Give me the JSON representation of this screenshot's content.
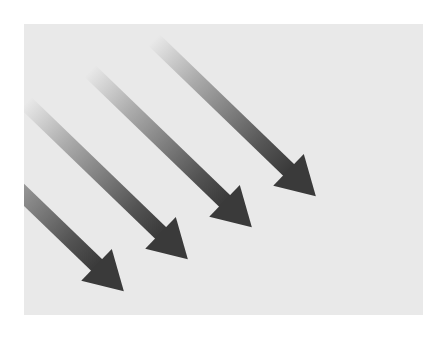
{
  "image": {
    "description": "Four parallel diagonal arrows pointing down-right on a light gray panel, each shaft fading from transparent at the tail to dark gray at the head",
    "background_color": "#ffffff",
    "panel_color": "#e9e9e9",
    "arrow_color": "#3a3a3a",
    "arrow_angle_deg": 44,
    "arrows": [
      {
        "id": "arrow-1",
        "tail": [
          154,
          40
        ],
        "tip": [
          316,
          196
        ]
      },
      {
        "id": "arrow-2",
        "tail": [
          90,
          71
        ],
        "tip": [
          252,
          227
        ]
      },
      {
        "id": "arrow-3",
        "tail": [
          26,
          103
        ],
        "tip": [
          188,
          259
        ]
      },
      {
        "id": "arrow-4",
        "tail": [
          -38,
          135
        ],
        "tip": [
          124,
          291
        ]
      }
    ]
  }
}
